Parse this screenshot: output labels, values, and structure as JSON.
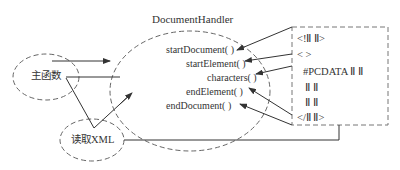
{
  "diagram": {
    "title": "DocumentHandler",
    "nodes": {
      "main": "主函数",
      "read_xml": "读取XML"
    },
    "methods": [
      "startDocument( )",
      "startElement( )",
      "characters( )",
      "endElement( )",
      "endDocument( )"
    ],
    "xml_lines": [
      "<!Ⅱ Ⅱ>",
      "< >",
      "#PCDATA Ⅱ Ⅱ",
      "Ⅱ Ⅱ",
      "Ⅱ Ⅱ",
      "</Ⅱ Ⅱ>"
    ],
    "colors": {
      "stroke": "#444444",
      "dash": "#666666",
      "text": "#333333"
    }
  }
}
